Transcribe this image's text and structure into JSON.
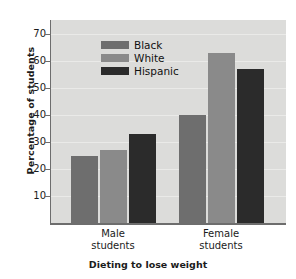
{
  "chart_data": {
    "type": "bar",
    "title": "",
    "xlabel": "Dieting to lose weight",
    "ylabel": "Percentage of students",
    "categories": [
      "Male students",
      "Female students"
    ],
    "category_lines": [
      [
        "Male",
        "students"
      ],
      [
        "Female",
        "students"
      ]
    ],
    "series": [
      {
        "name": "Black",
        "color": "#6e6e6e",
        "values": [
          25,
          40
        ]
      },
      {
        "name": "White",
        "color": "#8a8a8a",
        "values": [
          27,
          63
        ]
      },
      {
        "name": "Hispanic",
        "color": "#2b2b2b",
        "values": [
          33,
          57
        ]
      }
    ],
    "ylim": [
      0,
      70
    ],
    "yticks": [
      10,
      20,
      30,
      40,
      50,
      60,
      70
    ],
    "ytick_labels": [
      "10",
      "20",
      "30",
      "40",
      "50",
      "60",
      "70"
    ],
    "grid": true,
    "legend_position": "upper-left-inside",
    "plot_background": "#dcdcda",
    "axis_color": "#6d6d6d",
    "text_color": "#1b1b1b"
  }
}
